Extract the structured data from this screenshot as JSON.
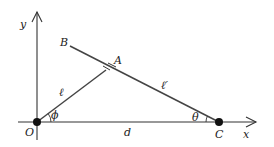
{
  "diagram": {
    "axes": {
      "x_label": "x",
      "y_label": "y"
    },
    "points": {
      "origin": "O",
      "end": "C",
      "top": "B",
      "contact": "A"
    },
    "segments": {
      "rod_OA": "ℓ",
      "rod_AC": "ℓ′",
      "base_OC": "d"
    },
    "angles": {
      "at_O": "ϕ",
      "at_C": "θ"
    },
    "colors": {
      "line": "#333333",
      "dot": "#111111"
    }
  }
}
